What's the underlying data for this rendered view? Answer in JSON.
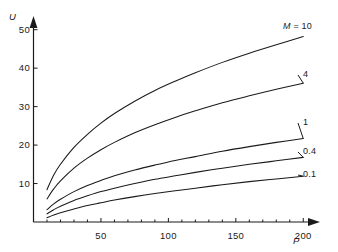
{
  "chart_data": {
    "type": "line",
    "title": "",
    "subtitle": "",
    "xlabel": "P",
    "ylabel": "U",
    "xlim": [
      0,
      205
    ],
    "ylim": [
      0,
      52
    ],
    "grid": false,
    "legend_position": "right-end-of-curve-labels",
    "x_ticks": [
      50,
      100,
      150,
      200
    ],
    "x_tick_labels": [
      "50",
      "100",
      "150",
      "200"
    ],
    "x_minor_tick_step": 10,
    "y_ticks": [
      10,
      20,
      30,
      40,
      50
    ],
    "y_tick_labels": [
      "10",
      "20",
      "30",
      "40",
      "50"
    ],
    "axis_arrowheads": true,
    "line_color": "#1a1a1a",
    "series": [
      {
        "name": "M = 10",
        "label": "M = 10",
        "param": "M",
        "value": "10",
        "x": [
          10,
          15,
          20,
          30,
          40,
          50,
          60,
          75,
          90,
          105,
          120,
          140,
          160,
          180,
          200
        ],
        "values": [
          8.4,
          12.2,
          15.0,
          19.4,
          22.8,
          25.7,
          28.2,
          31.4,
          34.2,
          36.6,
          38.8,
          41.5,
          43.9,
          46.1,
          48.2
        ]
      },
      {
        "name": "4",
        "label": "4",
        "param": "M",
        "value": "4",
        "x": [
          10,
          15,
          20,
          30,
          40,
          50,
          60,
          75,
          90,
          105,
          120,
          140,
          160,
          180,
          200
        ],
        "values": [
          6.0,
          8.6,
          10.7,
          14.0,
          16.6,
          18.8,
          20.7,
          23.2,
          25.3,
          27.2,
          28.9,
          31.0,
          32.8,
          34.5,
          36.1
        ]
      },
      {
        "name": "1",
        "label": "1",
        "param": "M",
        "value": "1",
        "x": [
          10,
          15,
          20,
          30,
          40,
          50,
          60,
          75,
          90,
          105,
          120,
          140,
          160,
          180,
          200
        ],
        "values": [
          3.2,
          4.7,
          5.9,
          7.9,
          9.5,
          10.8,
          12.0,
          13.5,
          14.8,
          16.0,
          17.0,
          18.4,
          19.6,
          20.7,
          21.7
        ]
      },
      {
        "name": "0.4",
        "label": "0.4",
        "param": "M",
        "value": "0.4",
        "x": [
          10,
          15,
          20,
          30,
          40,
          50,
          60,
          75,
          90,
          105,
          120,
          140,
          160,
          180,
          200
        ],
        "values": [
          2.1,
          3.2,
          4.1,
          5.6,
          6.8,
          7.9,
          8.8,
          10.0,
          11.1,
          12.0,
          12.9,
          14.0,
          15.0,
          15.9,
          16.8
        ]
      },
      {
        "name": "0.1",
        "label": "0.1",
        "param": "M",
        "value": "0.1",
        "x": [
          10,
          15,
          20,
          30,
          40,
          50,
          60,
          75,
          90,
          105,
          120,
          140,
          160,
          180,
          200
        ],
        "values": [
          1.1,
          1.8,
          2.4,
          3.4,
          4.3,
          5.0,
          5.7,
          6.6,
          7.4,
          8.1,
          8.8,
          9.7,
          10.5,
          11.2,
          11.9
        ]
      }
    ]
  },
  "axes": {
    "y_title": "U",
    "x_title": "P"
  }
}
